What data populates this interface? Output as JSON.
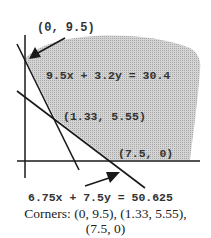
{
  "diagram": {
    "type": "linear-programming-feasible-region",
    "labels": {
      "top_corner": "(0, 9.5)",
      "constraint_1": "9.5x + 3.2y = 30.4",
      "middle_corner": "(1.33, 5.55)",
      "bottom_corner": "(7.5, 0)",
      "constraint_2": "6.75x + 7.5y = 50.625"
    },
    "caption": {
      "line1": "Corners:  (0, 9.5), (1.33, 5.55),",
      "line2": "(7.5, 0)"
    },
    "colors": {
      "shade": "#c8c8c8",
      "line": "#1a1a1a"
    }
  }
}
